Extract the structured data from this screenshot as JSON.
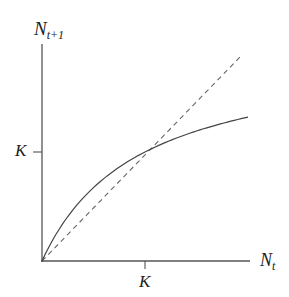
{
  "diagram": {
    "y_axis_label": {
      "main": "N",
      "sub": "t+1"
    },
    "x_axis_label": {
      "main": "N",
      "sub": "t"
    },
    "y_tick_label": "K",
    "x_tick_label": "K",
    "colors": {
      "axis": "#555555",
      "curve": "#444444",
      "dashed": "#666666",
      "text": "#222222"
    }
  },
  "chart_data": {
    "type": "line",
    "title": "",
    "xlabel": "N_t",
    "ylabel": "N_{t+1}",
    "x_ticks": [
      "K"
    ],
    "y_ticks": [
      "K"
    ],
    "grid": false,
    "legend": null,
    "series": [
      {
        "name": "N_{t+1} = f(N_t) (saturating curve)",
        "style": "solid",
        "x": [
          0,
          0.25,
          0.5,
          0.75,
          1.0,
          1.25,
          1.5,
          1.75,
          2.0
        ],
        "y": [
          0,
          0.42,
          0.7,
          0.88,
          1.0,
          1.1,
          1.18,
          1.25,
          1.32
        ]
      },
      {
        "name": "N_{t+1} = N_t (replacement line)",
        "style": "dashed",
        "x": [
          0,
          1.0,
          1.92
        ],
        "y": [
          0,
          1.0,
          1.89
        ]
      }
    ],
    "annotations": [
      "curves intersect at (K, K)"
    ],
    "xlim": [
      0,
      2.02
    ],
    "ylim": [
      0,
      1.99
    ]
  }
}
